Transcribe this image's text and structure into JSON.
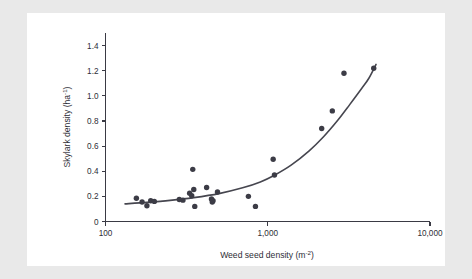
{
  "figure": {
    "panel_background": "#ffffff",
    "outer_background": "#e9e9e9",
    "ink_color": "#3c3c46",
    "curve_color": "#46464f"
  },
  "chart_data": {
    "type": "scatter",
    "title": "",
    "subtitle": "",
    "xlabel_text": "Weed seed density (m",
    "xlabel_sup": "-2",
    "xlabel_tail": ")",
    "xlabel_full": "Weed seed density (m-2)",
    "ylabel_text": "Skylark density (ha",
    "ylabel_sup": "-1",
    "ylabel_tail": ")",
    "ylabel_full": "Skylark density (ha-1)",
    "x_scale": "log",
    "y_scale": "linear",
    "xlim": [
      100,
      10000
    ],
    "ylim": [
      0,
      1.5
    ],
    "grid": false,
    "legend": "none",
    "x_ticks": [
      100,
      1000,
      10000
    ],
    "x_tick_labels": [
      "100",
      "1,000",
      "10,000"
    ],
    "y_ticks": [
      0,
      0.2,
      0.4,
      0.6,
      0.8,
      1.0,
      1.2,
      1.4
    ],
    "y_tick_labels": [
      "0",
      "0.2",
      "0.4",
      "0.6",
      "0.8",
      "1.0",
      "1.2",
      "1.4"
    ],
    "series": [
      {
        "name": "Observations",
        "marker": "filled-circle",
        "color": "#3c3c46",
        "points": [
          {
            "x": 155,
            "y": 0.185
          },
          {
            "x": 168,
            "y": 0.155
          },
          {
            "x": 180,
            "y": 0.125
          },
          {
            "x": 190,
            "y": 0.165
          },
          {
            "x": 200,
            "y": 0.16
          },
          {
            "x": 285,
            "y": 0.175
          },
          {
            "x": 300,
            "y": 0.17
          },
          {
            "x": 330,
            "y": 0.225
          },
          {
            "x": 340,
            "y": 0.205
          },
          {
            "x": 350,
            "y": 0.255
          },
          {
            "x": 345,
            "y": 0.415
          },
          {
            "x": 355,
            "y": 0.12
          },
          {
            "x": 420,
            "y": 0.27
          },
          {
            "x": 450,
            "y": 0.18
          },
          {
            "x": 455,
            "y": 0.155
          },
          {
            "x": 460,
            "y": 0.165
          },
          {
            "x": 490,
            "y": 0.235
          },
          {
            "x": 760,
            "y": 0.2
          },
          {
            "x": 840,
            "y": 0.12
          },
          {
            "x": 1080,
            "y": 0.495
          },
          {
            "x": 1100,
            "y": 0.37
          },
          {
            "x": 2150,
            "y": 0.74
          },
          {
            "x": 2500,
            "y": 0.88
          },
          {
            "x": 2950,
            "y": 1.18
          },
          {
            "x": 4500,
            "y": 1.22
          }
        ]
      }
    ],
    "fit_curve": {
      "name": "Fitted exponential trend",
      "color": "#46464f",
      "x_start": 132,
      "x_end": 4650,
      "points": [
        {
          "x": 132,
          "y": 0.14
        },
        {
          "x": 180,
          "y": 0.152
        },
        {
          "x": 250,
          "y": 0.168
        },
        {
          "x": 350,
          "y": 0.19
        },
        {
          "x": 500,
          "y": 0.222
        },
        {
          "x": 700,
          "y": 0.268
        },
        {
          "x": 900,
          "y": 0.315
        },
        {
          "x": 1100,
          "y": 0.368
        },
        {
          "x": 1400,
          "y": 0.45
        },
        {
          "x": 1800,
          "y": 0.562
        },
        {
          "x": 2200,
          "y": 0.672
        },
        {
          "x": 2700,
          "y": 0.805
        },
        {
          "x": 3200,
          "y": 0.93
        },
        {
          "x": 3800,
          "y": 1.06
        },
        {
          "x": 4200,
          "y": 1.14
        },
        {
          "x": 4650,
          "y": 1.25
        }
      ]
    }
  }
}
